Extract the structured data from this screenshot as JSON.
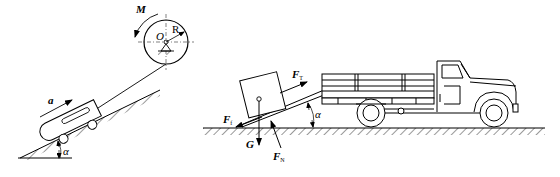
{
  "figure": {
    "left_panel": {
      "description": "Cart pulled up an inclined plane by a cable wound on a drum",
      "labels": {
        "moment": "M",
        "center": "O",
        "radius": "R",
        "acceleration": "a",
        "angle": "α"
      }
    },
    "right_panel": {
      "description": "Box on a ramp leaning against a truck with force diagram",
      "labels": {
        "tension": "F",
        "tension_sub": "T",
        "friction": "F",
        "friction_sub": "f",
        "gravity": "G",
        "normal": "F",
        "normal_sub": "N",
        "angle": "α"
      }
    },
    "colors": {
      "stroke": "#000000",
      "background": "#ffffff"
    }
  }
}
